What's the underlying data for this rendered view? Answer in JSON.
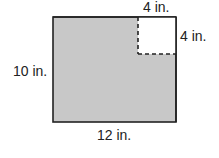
{
  "diagram": {
    "outer_rect": {
      "width_label": "12 in.",
      "height_label": "10 in.",
      "fill": "#c8c8c8",
      "stroke": "#222222"
    },
    "cutout_square": {
      "top_label": "4 in.",
      "side_label": "4 in.",
      "fill": "#ffffff",
      "stroke_style": "dashed"
    }
  }
}
